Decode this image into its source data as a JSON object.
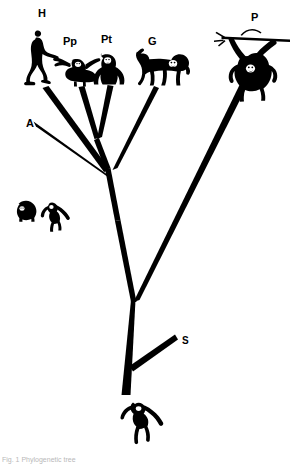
{
  "figure": {
    "type": "phylogenetic-tree-diagram",
    "background_color": "#ffffff",
    "ink_color": "#000000",
    "caption_fragment": "Fig. 1  Phylogenetic tree"
  },
  "labels": [
    {
      "id": "H",
      "text": "H",
      "x": 38,
      "y": 8,
      "taxon": "Homo sapiens"
    },
    {
      "id": "Pp",
      "text": "Pp",
      "x": 63,
      "y": 36,
      "taxon": "Pan paniscus"
    },
    {
      "id": "Pt",
      "text": "Pt",
      "x": 101,
      "y": 34,
      "taxon": "Pan troglodytes"
    },
    {
      "id": "G",
      "text": "G",
      "x": 148,
      "y": 36,
      "taxon": "Gorilla"
    },
    {
      "id": "P",
      "text": "P",
      "x": 251,
      "y": 12,
      "taxon": "Pongo"
    },
    {
      "id": "A",
      "text": "A",
      "x": 26,
      "y": 118,
      "taxon": "Hylobatidae"
    },
    {
      "id": "S",
      "text": "S",
      "x": 182,
      "y": 336,
      "taxon": "Sister outgroup"
    }
  ],
  "branches": [
    {
      "name": "branch-H",
      "label": "H"
    },
    {
      "name": "branch-Pp",
      "label": "Pp"
    },
    {
      "name": "branch-Pt",
      "label": "Pt"
    },
    {
      "name": "branch-G",
      "label": "G"
    },
    {
      "name": "branch-P",
      "label": "P"
    },
    {
      "name": "branch-A",
      "label": "A"
    },
    {
      "name": "branch-S",
      "label": "S"
    },
    {
      "name": "branch-trunk",
      "label": "root"
    }
  ],
  "silhouettes": [
    {
      "name": "human-silhouette",
      "label": "H",
      "pose": "walking biped"
    },
    {
      "name": "bonobo-silhouette",
      "label": "Pp",
      "pose": "arms outstretched"
    },
    {
      "name": "chimpanzee-silhouette",
      "label": "Pt",
      "pose": "knuckle-walking"
    },
    {
      "name": "gorilla-silhouette",
      "label": "G",
      "pose": "quadrupedal walk"
    },
    {
      "name": "orangutan-silhouette",
      "label": "P",
      "pose": "hanging from branch"
    },
    {
      "name": "siamang-silhouette",
      "label": "A",
      "pose": "crouching"
    },
    {
      "name": "gibbon-silhouette",
      "label": "A",
      "pose": "arm raised"
    },
    {
      "name": "outgroup-monkey-silhouette",
      "label": "S",
      "pose": "arm raised"
    }
  ]
}
